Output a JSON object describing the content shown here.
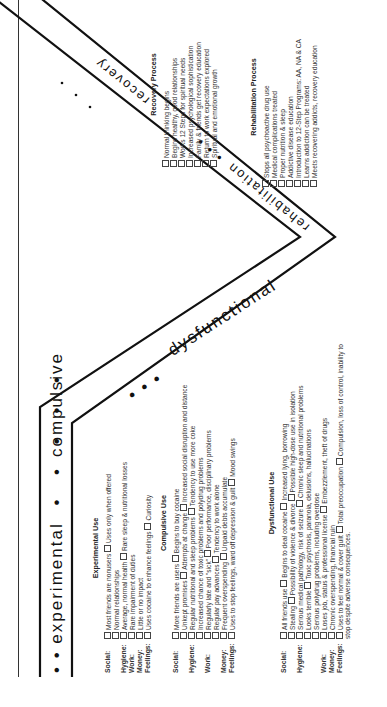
{
  "bands": {
    "experimental": "• • experimental",
    "experimental_dots": "• • • • •",
    "compulsive": "compulsive",
    "compulsive_dots": "• • •",
    "dysfunctional": "dysfunctional",
    "rehabilitation": "rehabilitation",
    "rehab_dots": "• • •",
    "recovery": "recovery",
    "recovery_dots": "• • •"
  },
  "experimental_use": {
    "title": "Experimental Use",
    "rows": [
      {
        "label": "Social:",
        "items": [
          "Most friends are nonusers",
          "Uses only when offered"
        ],
        "extra": "Normal relationships"
      },
      {
        "label": "Hygiene:",
        "items": [
          "Average, normal health",
          "Rare sleep & nutritional losses"
        ]
      },
      {
        "label": "Work:",
        "items": [
          "Rare impairment of duties"
        ]
      },
      {
        "label": "Money:",
        "items": [
          "Little or no impact"
        ]
      },
      {
        "label": "Feelings:",
        "items": [
          "Uses cocaine to enhance feelings",
          "Curiosity"
        ]
      }
    ]
  },
  "compulsive_use": {
    "title": "Compulsive Use",
    "rows": [
      {
        "label": "Social:",
        "items": [
          "More friends are users",
          "Begins to buy cocaine"
        ]
      },
      {
        "label": "",
        "items": [
          "Unkept promises",
          "Attempts at change",
          "Increased social disruption and distance"
        ]
      },
      {
        "label": "Hygiene:",
        "items": [
          "Regular nutritional and sleep problems",
          "Tendency to use more coke"
        ]
      },
      {
        "label": "",
        "items": [
          "Increased chance of toxic problems and polydrug problems"
        ]
      },
      {
        "label": "Work:",
        "items": [
          "Regularly late and \"sick\"",
          "Poor performance, disciplinary problems"
        ]
      },
      {
        "label": "",
        "items": [
          "Regular pay advances",
          "Tendency to work alone"
        ]
      },
      {
        "label": "Money:",
        "items": [
          "Frequent overspending",
          "Unpaid debts accumulate"
        ]
      },
      {
        "label": "Feelings:",
        "items": [
          "Uses to stop feelings, ward off depression & guilt",
          "Mood swings"
        ]
      }
    ]
  },
  "dysfunctional_use": {
    "title": "Dysfunctional Use",
    "rows": [
      {
        "label": "Social:",
        "items": [
          "All friends use",
          "Begins to deal cocaine",
          "Increased lying, borrowing"
        ]
      },
      {
        "label": "",
        "items": [
          "Stealing",
          "Possibility of violence & divorce",
          "Possible high-dose use in isolation"
        ]
      },
      {
        "label": "Hygiene:",
        "items": [
          "Serious medical pathology, risk of seizure",
          "Chronic sleep and nutritional problems"
        ]
      },
      {
        "label": "",
        "items": [
          "Looks terrible",
          "Toxic psychosis, paranoia, delusions, hallucinations"
        ]
      },
      {
        "label": "",
        "items": [
          "Serious polydrug problems, including overdose"
        ]
      },
      {
        "label": "Work:",
        "items": [
          "Loses job, status & professional license",
          "Embezzlement, theft of drugs"
        ]
      },
      {
        "label": "Money:",
        "items": [
          "Chronic overspending, financial ruin"
        ]
      },
      {
        "label": "Feelings:",
        "items": [
          "Uses to feel normal & cover guilt",
          "Total preoccupation",
          "Compulsion, loss of control, inability to stop despite adverse consequences."
        ]
      }
    ]
  },
  "rehabilitation_process": {
    "title": "Rehabilitation Process",
    "items": [
      "Stops all psychoactive drug use",
      "Medical complications treated",
      "Proper nutrition & sleep",
      "Addictive disease education",
      "Introduction to 12-Step Programs: AA, NA & CA",
      "Learns addiction can be treated",
      "Meets recovering addicts, recovery education"
    ]
  },
  "recovery_process": {
    "title": "Recovery Process",
    "items": [
      "Normal thinking begins",
      "Begins healthy, good relationships",
      "Works 12 Steps for spiritual needs",
      "Increased psychological sophistication",
      "Family & friends get recovery education",
      "Return to work expectations explored",
      "Spiritual and emotional growth"
    ]
  }
}
